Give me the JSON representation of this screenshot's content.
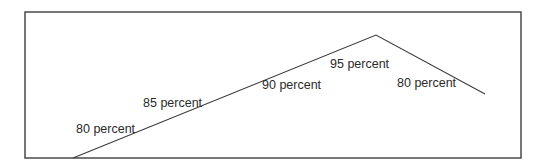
{
  "diagram": {
    "frame": {
      "x": 25,
      "y": 12,
      "width": 496,
      "height": 146,
      "stroke": "#4a4a4a"
    },
    "line": {
      "stroke": "#3a3a3a",
      "points": [
        [
          73,
          158
        ],
        [
          376,
          35
        ],
        [
          485,
          94
        ]
      ]
    },
    "labels": [
      {
        "text": "80 percent",
        "x": 76,
        "y": 133
      },
      {
        "text": "85 percent",
        "x": 143,
        "y": 107
      },
      {
        "text": "90 percent",
        "x": 262,
        "y": 89
      },
      {
        "text": "95 percent",
        "x": 330,
        "y": 68
      },
      {
        "text": "80 percent",
        "x": 397,
        "y": 87
      }
    ]
  }
}
